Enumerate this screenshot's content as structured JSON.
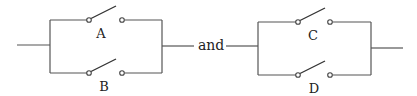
{
  "diagram": {
    "type": "parallel-switch-circuits",
    "connector_word": "and",
    "circuits": [
      {
        "name": "left",
        "switches": [
          {
            "label": "A",
            "position": "top",
            "state": "open"
          },
          {
            "label": "B",
            "position": "bottom",
            "state": "open"
          }
        ]
      },
      {
        "name": "right",
        "switches": [
          {
            "label": "C",
            "position": "top",
            "state": "open"
          },
          {
            "label": "D",
            "position": "bottom",
            "state": "open"
          }
        ]
      }
    ]
  }
}
